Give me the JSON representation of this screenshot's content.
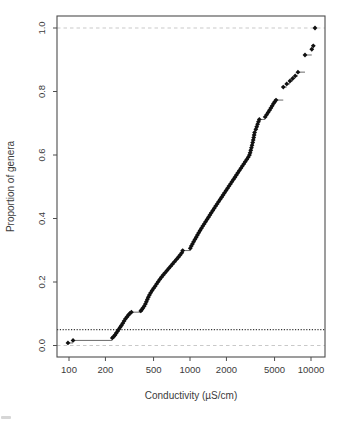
{
  "window": {
    "background": "#ffffff"
  },
  "chart_data": {
    "type": "scatter",
    "subtype": "empirical-cumulative-distribution",
    "title": "",
    "xlabel": "Conductivity (µS/cm)",
    "ylabel": "Proportion of genera",
    "x_scale": "log10",
    "x_ticks": [
      100,
      200,
      500,
      1000,
      2000,
      5000,
      10000
    ],
    "x_tick_labels": [
      "100",
      "200",
      "500",
      "1000",
      "2000",
      "5000",
      "10000"
    ],
    "x_range_approx": [
      80,
      13000
    ],
    "y_ticks": [
      0.0,
      0.2,
      0.4,
      0.6,
      0.8,
      1.0
    ],
    "y_tick_labels": [
      "0.0",
      "0.2",
      "0.4",
      "0.6",
      "0.8",
      "1.0"
    ],
    "y_range": [
      0,
      1
    ],
    "grid": "off",
    "legend": "none",
    "marker": "filled-diamond",
    "marker_color": "#111111",
    "step_line_color": "#6a6a6a",
    "axis_color": "#4d4d4d",
    "text_color": "#3b3b3b",
    "reference_lines": [
      {
        "name": "baseline-zero",
        "y": 0.0,
        "style": "dashed",
        "color": "#c9c9c9"
      },
      {
        "name": "baseline-one",
        "y": 1.0,
        "style": "dashed",
        "color": "#c9c9c9"
      },
      {
        "name": "hc05-threshold",
        "y": 0.05,
        "style": "dotted",
        "color": "#3a3a3a"
      }
    ],
    "points": [
      [
        98,
        0.008
      ],
      [
        108,
        0.016
      ],
      [
        228,
        0.024
      ],
      [
        234,
        0.028
      ],
      [
        240,
        0.033
      ],
      [
        246,
        0.039
      ],
      [
        252,
        0.045
      ],
      [
        258,
        0.051
      ],
      [
        264,
        0.057
      ],
      [
        271,
        0.063
      ],
      [
        278,
        0.07
      ],
      [
        285,
        0.077
      ],
      [
        293,
        0.084
      ],
      [
        301,
        0.09
      ],
      [
        310,
        0.096
      ],
      [
        318,
        0.101
      ],
      [
        328,
        0.105
      ],
      [
        392,
        0.109
      ],
      [
        400,
        0.113
      ],
      [
        408,
        0.118
      ],
      [
        418,
        0.124
      ],
      [
        428,
        0.131
      ],
      [
        436,
        0.138
      ],
      [
        444,
        0.145
      ],
      [
        452,
        0.152
      ],
      [
        462,
        0.159
      ],
      [
        473,
        0.166
      ],
      [
        486,
        0.173
      ],
      [
        500,
        0.18
      ],
      [
        515,
        0.187
      ],
      [
        530,
        0.194
      ],
      [
        546,
        0.201
      ],
      [
        562,
        0.208
      ],
      [
        580,
        0.215
      ],
      [
        600,
        0.222
      ],
      [
        622,
        0.229
      ],
      [
        645,
        0.236
      ],
      [
        668,
        0.243
      ],
      [
        692,
        0.25
      ],
      [
        718,
        0.257
      ],
      [
        745,
        0.264
      ],
      [
        772,
        0.271
      ],
      [
        800,
        0.278
      ],
      [
        828,
        0.285
      ],
      [
        856,
        0.292
      ],
      [
        870,
        0.299
      ],
      [
        1005,
        0.306
      ],
      [
        1025,
        0.313
      ],
      [
        1048,
        0.32
      ],
      [
        1072,
        0.327
      ],
      [
        1098,
        0.334
      ],
      [
        1125,
        0.341
      ],
      [
        1152,
        0.348
      ],
      [
        1180,
        0.355
      ],
      [
        1210,
        0.362
      ],
      [
        1242,
        0.369
      ],
      [
        1275,
        0.376
      ],
      [
        1310,
        0.383
      ],
      [
        1346,
        0.39
      ],
      [
        1383,
        0.397
      ],
      [
        1421,
        0.404
      ],
      [
        1460,
        0.411
      ],
      [
        1500,
        0.418
      ],
      [
        1542,
        0.425
      ],
      [
        1585,
        0.432
      ],
      [
        1630,
        0.439
      ],
      [
        1676,
        0.446
      ],
      [
        1724,
        0.453
      ],
      [
        1773,
        0.46
      ],
      [
        1824,
        0.467
      ],
      [
        1876,
        0.474
      ],
      [
        1930,
        0.481
      ],
      [
        1985,
        0.488
      ],
      [
        2042,
        0.495
      ],
      [
        2100,
        0.502
      ],
      [
        2160,
        0.509
      ],
      [
        2222,
        0.516
      ],
      [
        2286,
        0.523
      ],
      [
        2351,
        0.53
      ],
      [
        2418,
        0.537
      ],
      [
        2487,
        0.544
      ],
      [
        2558,
        0.551
      ],
      [
        2631,
        0.558
      ],
      [
        2706,
        0.565
      ],
      [
        2784,
        0.572
      ],
      [
        2863,
        0.579
      ],
      [
        2945,
        0.586
      ],
      [
        3029,
        0.593
      ],
      [
        3100,
        0.6
      ],
      [
        3140,
        0.607
      ],
      [
        3180,
        0.615
      ],
      [
        3220,
        0.623
      ],
      [
        3258,
        0.631
      ],
      [
        3296,
        0.639
      ],
      [
        3330,
        0.647
      ],
      [
        3360,
        0.655
      ],
      [
        3390,
        0.663
      ],
      [
        3420,
        0.671
      ],
      [
        3500,
        0.681
      ],
      [
        3560,
        0.689
      ],
      [
        3620,
        0.697
      ],
      [
        3680,
        0.705
      ],
      [
        3740,
        0.712
      ],
      [
        4180,
        0.72
      ],
      [
        4300,
        0.727
      ],
      [
        4420,
        0.734
      ],
      [
        4540,
        0.741
      ],
      [
        4660,
        0.748
      ],
      [
        4780,
        0.755
      ],
      [
        4900,
        0.762
      ],
      [
        5020,
        0.768
      ],
      [
        5140,
        0.773
      ],
      [
        5900,
        0.814
      ],
      [
        6300,
        0.824
      ],
      [
        6700,
        0.833
      ],
      [
        7050,
        0.841
      ],
      [
        7400,
        0.849
      ],
      [
        7800,
        0.861
      ],
      [
        8920,
        0.915
      ],
      [
        10150,
        0.933
      ],
      [
        10450,
        0.944
      ],
      [
        10790,
        1.0
      ]
    ]
  }
}
